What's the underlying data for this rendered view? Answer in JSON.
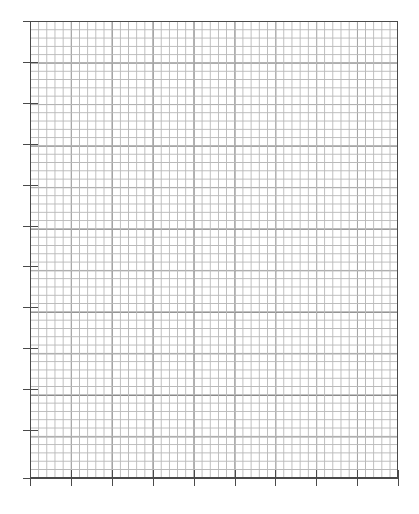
{
  "page": {
    "width": 419,
    "height": 514,
    "background_color": "#ffffff"
  },
  "grid": {
    "name": "graph-paper-grid",
    "left": 30,
    "top": 21,
    "width": 368,
    "height": 457,
    "major_columns": 9,
    "major_rows": 11,
    "minor_per_major": 5,
    "major_cell_px": 40.9,
    "minor_cell_px": 8.18,
    "minor_line_color": "#b9b9b9",
    "major_line_color": "#545454",
    "frame_line_color": "#4a4a4a",
    "minor_line_width_px": 1,
    "major_line_width_px": 1
  },
  "ticks": {
    "left": {
      "name": "y-axis-ticks",
      "count": 12,
      "length_px": 7,
      "color": "#4a4a4a",
      "thickness_px": 1,
      "positions_y": [
        21,
        62,
        103,
        144,
        185,
        226,
        266,
        307,
        348,
        389,
        430,
        478
      ]
    },
    "bottom": {
      "name": "x-axis-ticks",
      "count": 10,
      "length_px": 8,
      "color": "#4a4a4a",
      "thickness_px": 1,
      "positions_x": [
        30,
        71,
        112,
        153,
        194,
        235,
        275,
        316,
        357,
        398
      ]
    }
  },
  "axes": {
    "left_overhang_px": 6,
    "bottom_overhang_px": 6,
    "color": "#4a4a4a"
  }
}
